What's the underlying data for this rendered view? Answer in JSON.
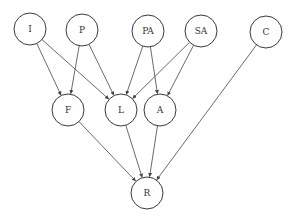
{
  "diagram": {
    "type": "directed-graph",
    "node_radius": 16,
    "colors": {
      "stroke": "#3a3a3a",
      "edge": "#444444",
      "label": "#333333",
      "background": "#ffffff"
    },
    "nodes": [
      {
        "id": "I",
        "label": "I",
        "x": 30,
        "y": 29
      },
      {
        "id": "P",
        "label": "P",
        "x": 82,
        "y": 30
      },
      {
        "id": "PA",
        "label": "PA",
        "x": 148,
        "y": 31
      },
      {
        "id": "SA",
        "label": "SA",
        "x": 201,
        "y": 31
      },
      {
        "id": "C",
        "label": "C",
        "x": 266,
        "y": 32
      },
      {
        "id": "F",
        "label": "F",
        "x": 68,
        "y": 110
      },
      {
        "id": "L",
        "label": "L",
        "x": 121,
        "y": 110
      },
      {
        "id": "A",
        "label": "A",
        "x": 160,
        "y": 110
      },
      {
        "id": "R",
        "label": "R",
        "x": 147,
        "y": 193
      }
    ],
    "edges": [
      {
        "from": "I",
        "to": "F"
      },
      {
        "from": "I",
        "to": "L"
      },
      {
        "from": "P",
        "to": "F"
      },
      {
        "from": "P",
        "to": "L"
      },
      {
        "from": "PA",
        "to": "L"
      },
      {
        "from": "PA",
        "to": "A"
      },
      {
        "from": "SA",
        "to": "L"
      },
      {
        "from": "SA",
        "to": "A"
      },
      {
        "from": "F",
        "to": "R"
      },
      {
        "from": "L",
        "to": "R"
      },
      {
        "from": "A",
        "to": "R"
      },
      {
        "from": "C",
        "to": "R"
      }
    ]
  }
}
